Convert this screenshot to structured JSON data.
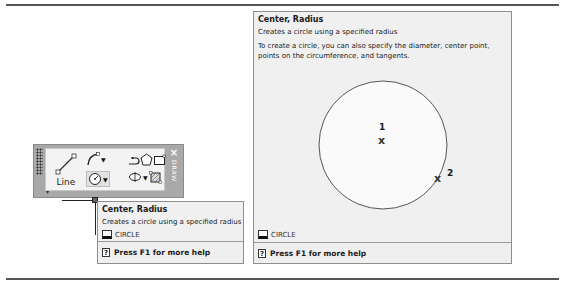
{
  "toolbar": {
    "line_label": "Line",
    "side_text": "DRAW",
    "close_glyph": "×",
    "tools": [
      {
        "name": "line",
        "icon": "line-icon"
      },
      {
        "name": "arc",
        "icon": "arc-icon",
        "has_dropdown": true
      },
      {
        "name": "polyline",
        "icon": "polyline-icon"
      },
      {
        "name": "polygon",
        "icon": "polygon-icon"
      },
      {
        "name": "rectangle",
        "icon": "rectangle-icon"
      },
      {
        "name": "circle",
        "icon": "circle-icon",
        "has_dropdown": true,
        "active": true
      },
      {
        "name": "ellipse",
        "icon": "ellipse-icon",
        "has_dropdown": true
      },
      {
        "name": "hatch",
        "icon": "hatch-icon"
      }
    ],
    "dropdown_glyph": "▼",
    "expand_glyph": "▾"
  },
  "tooltip_small": {
    "title": "Center, Radius",
    "description": "Creates a circle using a specified radius",
    "command": "CIRCLE",
    "help": "Press F1 for more help",
    "help_glyph": "?"
  },
  "tooltip_large": {
    "title": "Center, Radius",
    "description": "Creates a circle using a specified radius",
    "detail": "To create a circle, you can also specify the diameter, center point, points on the circumference, and tangents.",
    "illustration": {
      "point1_label": "1",
      "point2_label": "2",
      "marker_glyph": "x"
    },
    "command": "CIRCLE",
    "help": "Press F1 for more help",
    "help_glyph": "?"
  },
  "colors": {
    "toolbar_frame": "#a9a9a9",
    "tooltip_bg": "#f0f0f0",
    "border": "#8e8e8e"
  }
}
